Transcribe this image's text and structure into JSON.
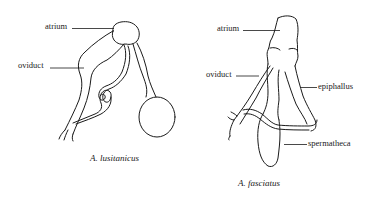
{
  "figure": {
    "left": {
      "caption": "A. lusitanicus",
      "labels": {
        "atrium": "atrium",
        "oviduct": "oviduct"
      }
    },
    "right": {
      "caption": "A. fasciatus",
      "labels": {
        "atrium": "atrium",
        "oviduct": "oviduct",
        "epiphallus": "epiphallus",
        "spermatheca": "spermatheca"
      }
    }
  }
}
